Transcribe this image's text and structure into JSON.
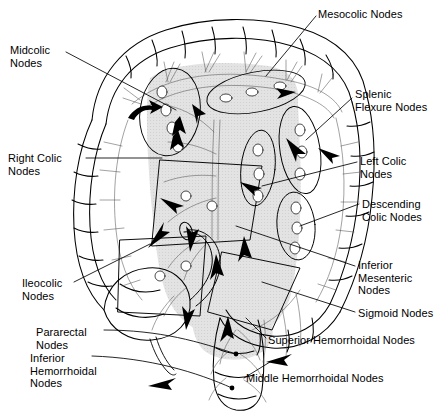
{
  "figure": {
    "background_color": "#ffffff",
    "ink_color": "#000000",
    "shading_color": "#d9d9d9",
    "width": 435,
    "height": 416
  },
  "labels": [
    {
      "id": "mesocolic",
      "text": "Mesocolic Nodes",
      "x": 318,
      "y": 8,
      "align": "left"
    },
    {
      "id": "midcolic",
      "text": "Midcolic\nNodes",
      "x": 10,
      "y": 44,
      "align": "left"
    },
    {
      "id": "splenic-flexure",
      "text": "Splenic\nFlexure Nodes",
      "x": 355,
      "y": 88,
      "align": "left"
    },
    {
      "id": "right-colic",
      "text": "Right Colic\nNodes",
      "x": 8,
      "y": 152,
      "align": "left"
    },
    {
      "id": "left-colic",
      "text": "Left Colic\nNodes",
      "x": 360,
      "y": 155,
      "align": "left"
    },
    {
      "id": "descending-colic",
      "text": "Descending\nColic Nodes",
      "x": 362,
      "y": 198,
      "align": "left"
    },
    {
      "id": "inferior-mesenteric",
      "text": "Inferior\nMesenteric\nNodes",
      "x": 358,
      "y": 259,
      "align": "left"
    },
    {
      "id": "ileocolic",
      "text": "Ileocolic\nNodes",
      "x": 22,
      "y": 277,
      "align": "left"
    },
    {
      "id": "sigmoid",
      "text": "Sigmoid Nodes",
      "x": 358,
      "y": 307,
      "align": "left"
    },
    {
      "id": "pararectal",
      "text": "Pararectal\nNodes",
      "x": 36,
      "y": 326,
      "align": "left"
    },
    {
      "id": "superior-hemorrhoidal",
      "text": "Superior Hemorrhoidal Nodes",
      "x": 268,
      "y": 334,
      "align": "left"
    },
    {
      "id": "inferior-hemorrhoidal",
      "text": "Inferior\nHemorrhoidal\nNodes",
      "x": 30,
      "y": 352,
      "align": "left"
    },
    {
      "id": "middle-hemorrhoidal",
      "text": "Middle Hemorrhoidal Nodes",
      "x": 246,
      "y": 372,
      "align": "left"
    }
  ],
  "anatomy": {
    "structures": [
      "transverse-colon",
      "ascending-colon",
      "descending-colon",
      "hepatic-flexure",
      "splenic-flexure",
      "cecum",
      "appendix",
      "terminal-ileum",
      "sigmoid-colon",
      "rectum",
      "mesocolon",
      "mesentery"
    ],
    "node_groups": [
      "mesocolic",
      "midcolic",
      "right-colic",
      "left-colic",
      "splenic-flexure",
      "descending-colic",
      "ileocolic",
      "inferior-mesenteric",
      "sigmoid",
      "pararectal",
      "superior-hemorrhoidal",
      "middle-hemorrhoidal",
      "inferior-hemorrhoidal"
    ],
    "flow_arrow_count": 14,
    "arrow_meaning": "direction of lymphatic drainage"
  }
}
